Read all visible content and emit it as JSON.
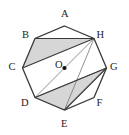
{
  "figure": {
    "kind": "geometry-diagram",
    "shape_name": "regular octagon",
    "stroke_color": "#3a3a3a",
    "thin_stroke_color": "#6e6e6e",
    "shade_color": "#d6d6d6",
    "background_color": "#ffffff",
    "label_color": "#1b1b1b",
    "vertices": [
      {
        "label": "A",
        "x": 64.5,
        "y": 26.0,
        "label_x": 61.0,
        "label_y": 9.0
      },
      {
        "label": "B",
        "x": 35.0,
        "y": 38.5,
        "label_x": 22.0,
        "label_y": 29.5
      },
      {
        "label": "C",
        "x": 22.5,
        "y": 68.0,
        "label_x": 8.5,
        "label_y": 62.0
      },
      {
        "label": "D",
        "x": 35.0,
        "y": 97.5,
        "label_x": 21.0,
        "label_y": 98.0
      },
      {
        "label": "E",
        "x": 64.5,
        "y": 110.0,
        "label_x": 61.0,
        "label_y": 119.0
      },
      {
        "label": "F",
        "x": 94.0,
        "y": 97.5,
        "label_x": 96.5,
        "label_y": 98.0
      },
      {
        "label": "G",
        "x": 106.5,
        "y": 68.0,
        "label_x": 110.0,
        "label_y": 62.0
      },
      {
        "label": "H",
        "x": 94.0,
        "y": 38.5,
        "label_x": 96.5,
        "label_y": 29.5
      }
    ],
    "center": {
      "label": "O",
      "x": 64.5,
      "y": 68.0,
      "label_x": 55.0,
      "label_y": 60.0,
      "dot_radius": 2.1
    },
    "shaded_triangles": [
      {
        "name": "triangle-BCH",
        "points": "35,38.5 22.5,68 94,38.5"
      },
      {
        "name": "triangle-DEG",
        "points": "35,97.5 64.5,110 106.5,68"
      }
    ],
    "diagonals": [
      {
        "name": "segment-BH",
        "x1": 35.0,
        "y1": 38.5,
        "x2": 94.0,
        "y2": 38.5,
        "weight": "thick"
      },
      {
        "name": "segment-CH",
        "x1": 22.5,
        "y1": 68.0,
        "x2": 94.0,
        "y2": 38.5,
        "weight": "thick"
      },
      {
        "name": "segment-DG",
        "x1": 35.0,
        "y1": 97.5,
        "x2": 106.5,
        "y2": 68.0,
        "weight": "thick"
      },
      {
        "name": "segment-EG",
        "x1": 64.5,
        "y1": 110.0,
        "x2": 106.5,
        "y2": 68.0,
        "weight": "thick"
      },
      {
        "name": "segment-DE-chord",
        "x1": 35.0,
        "y1": 97.5,
        "x2": 64.5,
        "y2": 110.0,
        "weight": "thick"
      },
      {
        "name": "segment-HD-through-O",
        "x1": 94.0,
        "y1": 38.5,
        "x2": 35.0,
        "y2": 97.5,
        "weight": "thin"
      },
      {
        "name": "segment-HE",
        "x1": 94.0,
        "y1": 38.5,
        "x2": 64.5,
        "y2": 110.0,
        "weight": "thin"
      },
      {
        "name": "segment-DG-thin",
        "x1": 35.0,
        "y1": 97.5,
        "x2": 106.5,
        "y2": 68.0,
        "weight": "thin"
      }
    ],
    "outline_points": "64.5,26 94,38.5 106.5,68 94,97.5 64.5,110 35,97.5 22.5,68 35,38.5"
  }
}
